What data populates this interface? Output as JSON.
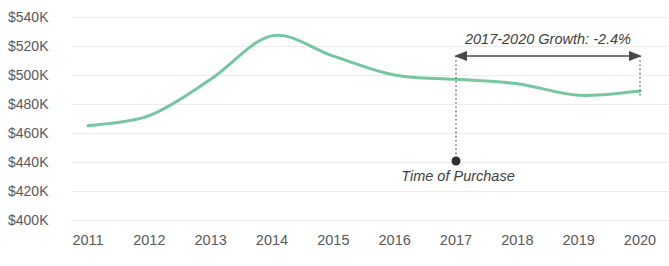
{
  "chart_data": {
    "type": "line",
    "title": "",
    "xlabel": "",
    "ylabel": "",
    "x": [
      2011,
      2012,
      2013,
      2014,
      2015,
      2016,
      2017,
      2018,
      2019,
      2020
    ],
    "categories": [
      "2011",
      "2012",
      "2013",
      "2014",
      "2015",
      "2016",
      "2017",
      "2018",
      "2019",
      "2020"
    ],
    "series": [
      {
        "name": "Home Value",
        "color": "#74c6a0",
        "values": [
          465000,
          472000,
          497000,
          527000,
          513000,
          500000,
          497000,
          494000,
          486000,
          489000
        ]
      }
    ],
    "ylim": [
      400000,
      545000
    ],
    "yticks": [
      540000,
      520000,
      500000,
      480000,
      460000,
      440000,
      420000,
      400000
    ],
    "ytick_labels": [
      "$540K",
      "$520K",
      "$500K",
      "$480K",
      "$460K",
      "$440K",
      "$420K",
      "$400K"
    ],
    "xtick_labels": [
      "2011",
      "2012",
      "2013",
      "2014",
      "2015",
      "2016",
      "2017",
      "2018",
      "2019",
      "2020"
    ],
    "grid": true,
    "grid_axis": "y",
    "legend": false,
    "annotations": [
      {
        "id": "growth-span",
        "text": "2017-2020 Growth: -2.4%",
        "start_x": 2017,
        "end_x": 2020,
        "style": "double-arrow",
        "value": "-2.4%"
      },
      {
        "id": "purchase-marker",
        "text": "Time of Purchase",
        "at_x": 2017,
        "style": "dot-with-dotted-line"
      }
    ]
  },
  "axis": {
    "y_labels": [
      "$540K",
      "$520K",
      "$500K",
      "$480K",
      "$460K",
      "$440K",
      "$420K",
      "$400K"
    ],
    "x_labels": [
      "2011",
      "2012",
      "2013",
      "2014",
      "2015",
      "2016",
      "2017",
      "2018",
      "2019",
      "2020"
    ]
  },
  "annotations": {
    "growth_label": "2017-2020 Growth: -2.4%",
    "purchase_label": "Time of Purchase"
  },
  "colors": {
    "series": "#74c6a0",
    "grid": "#ececec",
    "tick_text": "#58595b",
    "annotation_text": "#3f3f41",
    "marker": "#2f2f2f"
  }
}
